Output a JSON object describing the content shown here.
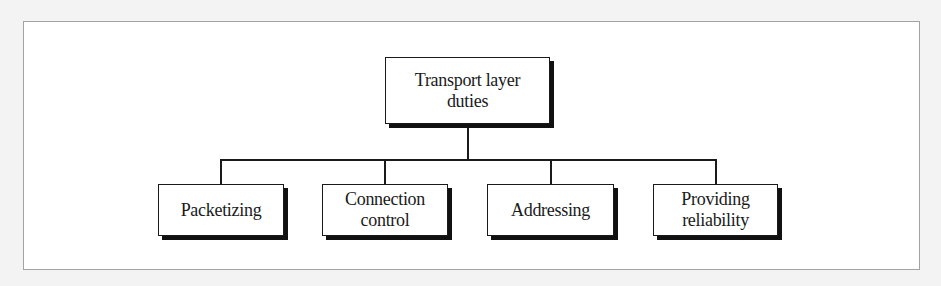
{
  "diagram": {
    "type": "tree",
    "root": {
      "label_line1": "Transport layer",
      "label_line2": "duties"
    },
    "children": [
      {
        "label_line1": "Packetizing",
        "label_line2": ""
      },
      {
        "label_line1": "Connection",
        "label_line2": "control"
      },
      {
        "label_line1": "Addressing",
        "label_line2": ""
      },
      {
        "label_line1": "Providing",
        "label_line2": "reliability"
      }
    ],
    "colors": {
      "box_border": "#1a1a1a",
      "box_shadow": "#111111",
      "frame_border": "#a3a3a3",
      "background": "#ffffff"
    }
  }
}
